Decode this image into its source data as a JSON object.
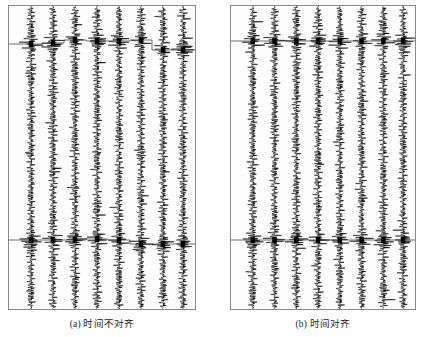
{
  "figure": {
    "title": "",
    "panels": [
      {
        "id": "a",
        "caption": "(a) 时间不对齐",
        "aligned": false,
        "trace_count": 8,
        "marker_lines": 2
      },
      {
        "id": "b",
        "caption": "(b) 时间对齐",
        "aligned": true,
        "trace_count": 8,
        "marker_lines": 2
      }
    ]
  },
  "colors": {
    "background": "#ffffff",
    "panel_background": "#fdfdfd",
    "panel_border": "#8a8a8a",
    "trace": "#000000",
    "marker_line": "#4a4a4a",
    "caption_text": "#1a1a1a"
  },
  "chart_data": {
    "type": "line",
    "title": "",
    "xlabel": "",
    "ylabel": "",
    "grid": false,
    "legend_position": "none",
    "panels": [
      {
        "id": "a",
        "label": "(a) 时间不对齐",
        "trace_centers_px": [
          30,
          52,
          74,
          96,
          118,
          140,
          162,
          182
        ],
        "trace_half_width_px": 9,
        "time_top_px": 6,
        "time_bottom_px": 309,
        "marker_horizons": [
          {
            "name": "horizon-1",
            "aligned": false,
            "pick_times_px": [
              44,
              43,
              40,
              41,
              41,
              40,
              50,
              50
            ]
          },
          {
            "name": "horizon-2",
            "aligned": false,
            "pick_times_px": [
              240,
              240,
              240,
              239,
              240,
              244,
              244,
              244
            ]
          }
        ],
        "seed": 101
      },
      {
        "id": "b",
        "label": "(b) 时间对齐",
        "trace_centers_px": [
          30,
          52,
          74,
          96,
          118,
          140,
          162,
          182
        ],
        "trace_half_width_px": 9,
        "time_top_px": 6,
        "time_bottom_px": 309,
        "marker_horizons": [
          {
            "name": "horizon-1",
            "aligned": true,
            "pick_times_px": [
              41,
              41,
              41,
              41,
              41,
              41,
              41,
              41
            ]
          },
          {
            "name": "horizon-2",
            "aligned": true,
            "pick_times_px": [
              240,
              240,
              240,
              240,
              240,
              240,
              240,
              240
            ]
          }
        ],
        "seed": 202
      }
    ]
  }
}
